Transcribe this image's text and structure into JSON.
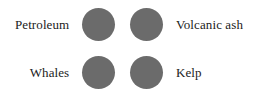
{
  "figure": {
    "background_color": "#ffffff",
    "marker_color": "#6b6b6b",
    "text_color": "#1b1b1b",
    "layout": "2x2-legend-grid"
  },
  "chart_data": {
    "type": "table",
    "title": "",
    "xlabel": "",
    "ylabel": "",
    "legend_position": "inline-grid",
    "categories": [
      "Petroleum",
      "Volcanic ash",
      "Whales",
      "Kelp"
    ],
    "values": [
      1,
      1,
      1,
      1
    ],
    "series": [
      {
        "name": "markers",
        "values": [
          1,
          1,
          1,
          1
        ]
      }
    ],
    "annotations": [
      "Petroleum",
      "Volcanic ash",
      "Whales",
      "Kelp"
    ]
  },
  "rows": [
    {
      "left_label": "Petroleum",
      "left_marker": "circle-marker",
      "right_marker": "circle-marker",
      "right_label": "Volcanic ash"
    },
    {
      "left_label": "Whales",
      "left_marker": "circle-marker",
      "right_marker": "circle-marker",
      "right_label": "Kelp"
    }
  ]
}
